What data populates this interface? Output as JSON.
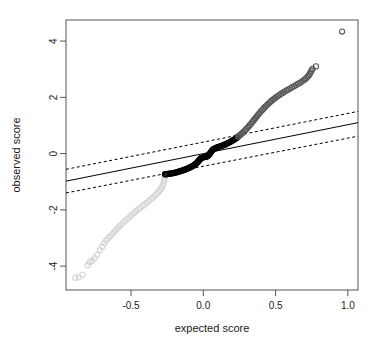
{
  "chart_data": {
    "type": "scatter",
    "title": "",
    "xlabel": "expected score",
    "ylabel": "observed score",
    "xlim": [
      -0.95,
      1.07
    ],
    "ylim": [
      -4.85,
      4.75
    ],
    "xticks": [
      -0.5,
      0.0,
      0.5,
      1.0
    ],
    "xticklabels": [
      "-0.5",
      "0.0",
      "0.5",
      "1.0"
    ],
    "yticks": [
      4,
      2,
      0,
      -2,
      -4
    ],
    "yticklabels": [
      "4",
      "2",
      "0",
      "-2",
      "-4"
    ],
    "grid": false,
    "legend": null,
    "frame": true,
    "series": [
      {
        "name": "lower-tail-points",
        "marker": "open-circle",
        "color": "#d4d4d4",
        "points": [
          [
            -0.885,
            -4.41
          ],
          [
            -0.862,
            -4.4
          ],
          [
            -0.836,
            -4.31
          ],
          [
            -0.8,
            -3.97
          ],
          [
            -0.786,
            -3.86
          ],
          [
            -0.77,
            -3.81
          ],
          [
            -0.752,
            -3.72
          ],
          [
            -0.735,
            -3.6
          ],
          [
            -0.716,
            -3.43
          ],
          [
            -0.7,
            -3.31
          ],
          [
            -0.686,
            -3.19
          ],
          [
            -0.672,
            -3.09
          ],
          [
            -0.658,
            -3.01
          ],
          [
            -0.645,
            -2.94
          ],
          [
            -0.63,
            -2.86
          ],
          [
            -0.616,
            -2.78
          ],
          [
            -0.602,
            -2.7
          ],
          [
            -0.588,
            -2.62
          ],
          [
            -0.573,
            -2.55
          ],
          [
            -0.558,
            -2.47
          ],
          [
            -0.543,
            -2.4
          ],
          [
            -0.528,
            -2.33
          ],
          [
            -0.512,
            -2.26
          ],
          [
            -0.497,
            -2.19
          ],
          [
            -0.481,
            -2.12
          ],
          [
            -0.466,
            -2.05
          ],
          [
            -0.45,
            -1.98
          ],
          [
            -0.435,
            -1.92
          ],
          [
            -0.42,
            -1.86
          ],
          [
            -0.405,
            -1.8
          ],
          [
            -0.39,
            -1.74
          ],
          [
            -0.376,
            -1.68
          ],
          [
            -0.362,
            -1.62
          ],
          [
            -0.349,
            -1.56
          ],
          [
            -0.336,
            -1.5
          ],
          [
            -0.324,
            -1.44
          ],
          [
            -0.312,
            -1.37
          ],
          [
            -0.301,
            -1.31
          ],
          [
            -0.291,
            -1.24
          ],
          [
            -0.283,
            -1.16
          ],
          [
            -0.276,
            -1.07
          ],
          [
            -0.271,
            -0.97
          ],
          [
            -0.268,
            -0.88
          ],
          [
            -0.266,
            -0.8
          ],
          [
            -0.265,
            -0.74
          ]
        ]
      },
      {
        "name": "central-points",
        "marker": "open-circle",
        "color": "#000000",
        "points": [
          [
            -0.265,
            -0.735
          ],
          [
            -0.258,
            -0.73
          ],
          [
            -0.25,
            -0.726
          ],
          [
            -0.242,
            -0.721
          ],
          [
            -0.234,
            -0.716
          ],
          [
            -0.226,
            -0.71
          ],
          [
            -0.218,
            -0.703
          ],
          [
            -0.21,
            -0.695
          ],
          [
            -0.202,
            -0.686
          ],
          [
            -0.194,
            -0.676
          ],
          [
            -0.186,
            -0.666
          ],
          [
            -0.178,
            -0.655
          ],
          [
            -0.17,
            -0.643
          ],
          [
            -0.162,
            -0.63
          ],
          [
            -0.154,
            -0.617
          ],
          [
            -0.146,
            -0.603
          ],
          [
            -0.138,
            -0.589
          ],
          [
            -0.13,
            -0.574
          ],
          [
            -0.122,
            -0.558
          ],
          [
            -0.114,
            -0.541
          ],
          [
            -0.106,
            -0.524
          ],
          [
            -0.098,
            -0.505
          ],
          [
            -0.09,
            -0.486
          ],
          [
            -0.082,
            -0.465
          ],
          [
            -0.074,
            -0.443
          ],
          [
            -0.067,
            -0.42
          ],
          [
            -0.06,
            -0.395
          ],
          [
            -0.053,
            -0.368
          ],
          [
            -0.047,
            -0.34
          ],
          [
            -0.041,
            -0.31
          ],
          [
            -0.036,
            -0.28
          ],
          [
            -0.031,
            -0.25
          ],
          [
            -0.027,
            -0.222
          ],
          [
            -0.022,
            -0.196
          ],
          [
            -0.017,
            -0.174
          ],
          [
            -0.012,
            -0.156
          ],
          [
            -0.006,
            -0.142
          ],
          [
            0.0,
            -0.132
          ],
          [
            0.006,
            -0.124
          ],
          [
            0.012,
            -0.117
          ],
          [
            0.018,
            -0.11
          ],
          [
            0.024,
            -0.101
          ],
          [
            0.03,
            -0.088
          ],
          [
            0.035,
            -0.068
          ],
          [
            0.04,
            -0.04
          ],
          [
            0.045,
            -0.004
          ],
          [
            0.05,
            0.035
          ],
          [
            0.055,
            0.073
          ],
          [
            0.06,
            0.107
          ],
          [
            0.066,
            0.136
          ],
          [
            0.072,
            0.16
          ],
          [
            0.078,
            0.18
          ],
          [
            0.085,
            0.197
          ],
          [
            0.092,
            0.212
          ],
          [
            0.099,
            0.226
          ],
          [
            0.107,
            0.24
          ],
          [
            0.115,
            0.254
          ],
          [
            0.123,
            0.269
          ],
          [
            0.131,
            0.285
          ],
          [
            0.139,
            0.301
          ],
          [
            0.147,
            0.318
          ],
          [
            0.155,
            0.336
          ],
          [
            0.163,
            0.355
          ],
          [
            0.171,
            0.375
          ],
          [
            0.179,
            0.396
          ],
          [
            0.187,
            0.418
          ],
          [
            0.195,
            0.441
          ],
          [
            0.203,
            0.465
          ],
          [
            0.211,
            0.49
          ],
          [
            0.219,
            0.517
          ],
          [
            0.227,
            0.545
          ],
          [
            0.234,
            0.574
          ],
          [
            0.241,
            0.604
          ]
        ]
      },
      {
        "name": "upper-tail-points",
        "marker": "open-circle",
        "color": "#585858",
        "points": [
          [
            0.241,
            0.604
          ],
          [
            0.249,
            0.636
          ],
          [
            0.257,
            0.67
          ],
          [
            0.265,
            0.706
          ],
          [
            0.273,
            0.744
          ],
          [
            0.281,
            0.784
          ],
          [
            0.289,
            0.826
          ],
          [
            0.297,
            0.87
          ],
          [
            0.305,
            0.915
          ],
          [
            0.313,
            0.962
          ],
          [
            0.321,
            1.01
          ],
          [
            0.329,
            1.059
          ],
          [
            0.337,
            1.109
          ],
          [
            0.345,
            1.16
          ],
          [
            0.353,
            1.212
          ],
          [
            0.361,
            1.264
          ],
          [
            0.369,
            1.317
          ],
          [
            0.377,
            1.37
          ],
          [
            0.386,
            1.423
          ],
          [
            0.395,
            1.476
          ],
          [
            0.404,
            1.528
          ],
          [
            0.413,
            1.58
          ],
          [
            0.422,
            1.631
          ],
          [
            0.431,
            1.681
          ],
          [
            0.441,
            1.73
          ],
          [
            0.451,
            1.778
          ],
          [
            0.461,
            1.825
          ],
          [
            0.471,
            1.871
          ],
          [
            0.482,
            1.916
          ],
          [
            0.493,
            1.96
          ],
          [
            0.504,
            2.003
          ],
          [
            0.515,
            2.045
          ],
          [
            0.527,
            2.086
          ],
          [
            0.539,
            2.127
          ],
          [
            0.551,
            2.167
          ],
          [
            0.563,
            2.206
          ],
          [
            0.576,
            2.245
          ],
          [
            0.589,
            2.283
          ],
          [
            0.602,
            2.321
          ],
          [
            0.615,
            2.359
          ],
          [
            0.628,
            2.397
          ],
          [
            0.641,
            2.435
          ],
          [
            0.654,
            2.474
          ],
          [
            0.667,
            2.513
          ],
          [
            0.679,
            2.553
          ],
          [
            0.691,
            2.595
          ],
          [
            0.702,
            2.638
          ],
          [
            0.712,
            2.683
          ],
          [
            0.721,
            2.73
          ],
          [
            0.729,
            2.78
          ],
          [
            0.736,
            2.833
          ],
          [
            0.742,
            2.889
          ],
          [
            0.748,
            2.948
          ],
          [
            0.755,
            3.01
          ],
          [
            0.779,
            3.1
          ]
        ]
      },
      {
        "name": "extreme-outlier",
        "marker": "open-circle",
        "color": "#585858",
        "points": [
          [
            0.96,
            4.34
          ]
        ]
      }
    ],
    "reference_line": {
      "name": "fitted-line",
      "style": "solid",
      "color": "#000000",
      "x": [
        -0.95,
        1.07
      ],
      "y": [
        -0.98,
        1.1
      ]
    },
    "confidence_bands": [
      {
        "name": "upper-confidence-band",
        "style": "dashed",
        "color": "#000000",
        "x": [
          -0.95,
          1.07
        ],
        "y": [
          -0.56,
          1.5
        ]
      },
      {
        "name": "lower-confidence-band",
        "style": "dashed",
        "color": "#000000",
        "x": [
          -0.95,
          1.07
        ],
        "y": [
          -1.4,
          0.62
        ]
      }
    ]
  }
}
